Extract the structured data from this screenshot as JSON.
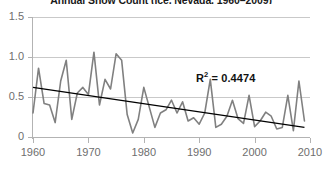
{
  "title": "Annual Snow Count (ice, Nevada, 1960–2009)",
  "r2_label": "R",
  "r2_exponent": "2",
  "r2_value": " = 0.4474",
  "colors": {
    "series": "#808080",
    "trend": "#000000",
    "grid": "#c9c9c9",
    "axis": "#b3b3b3",
    "tick_text": "#6e6e6e",
    "annotation": "#111111"
  },
  "axes": {
    "y_ticks": [
      "1.5",
      "1.0",
      "0.5",
      "0"
    ],
    "y_tick_values": [
      1.5,
      1.0,
      0.5,
      0
    ],
    "x_ticks": [
      "1960",
      "1970",
      "1980",
      "1990",
      "2000",
      "2010"
    ],
    "x_tick_values": [
      1960,
      1970,
      1980,
      1990,
      2000,
      2010
    ]
  },
  "chart_data": {
    "type": "line",
    "title": "Annual Snow Count (ice, Nevada, 1960–2009)",
    "xlabel": "",
    "ylabel": "",
    "xlim": [
      1960,
      2010
    ],
    "ylim": [
      0,
      1.5
    ],
    "grid": true,
    "legend": "none",
    "annotations": [
      {
        "text": "R² = 0.4474",
        "x": 1990,
        "y": 0.72,
        "bold": true
      }
    ],
    "series": [
      {
        "name": "Annual count",
        "color": "#808080",
        "x": [
          1960,
          1961,
          1962,
          1963,
          1964,
          1965,
          1966,
          1967,
          1968,
          1969,
          1970,
          1971,
          1972,
          1973,
          1974,
          1975,
          1976,
          1977,
          1978,
          1979,
          1980,
          1981,
          1982,
          1983,
          1984,
          1985,
          1986,
          1987,
          1988,
          1989,
          1990,
          1991,
          1992,
          1993,
          1994,
          1995,
          1996,
          1997,
          1998,
          1999,
          2000,
          2001,
          2002,
          2003,
          2004,
          2005,
          2006,
          2007,
          2008,
          2009
        ],
        "values": [
          0.3,
          0.86,
          0.42,
          0.4,
          0.18,
          0.7,
          0.96,
          0.22,
          0.55,
          0.62,
          0.53,
          1.06,
          0.4,
          0.72,
          0.6,
          1.04,
          0.96,
          0.28,
          0.05,
          0.22,
          0.62,
          0.37,
          0.12,
          0.3,
          0.34,
          0.46,
          0.3,
          0.44,
          0.2,
          0.24,
          0.16,
          0.3,
          0.72,
          0.12,
          0.16,
          0.26,
          0.46,
          0.23,
          0.17,
          0.52,
          0.13,
          0.2,
          0.31,
          0.26,
          0.1,
          0.12,
          0.52,
          0.08,
          0.7,
          0.2
        ]
      },
      {
        "name": "Linear trend",
        "color": "#000000",
        "type": "trendline",
        "x": [
          1960,
          2009
        ],
        "values": [
          0.62,
          0.12
        ]
      }
    ]
  }
}
